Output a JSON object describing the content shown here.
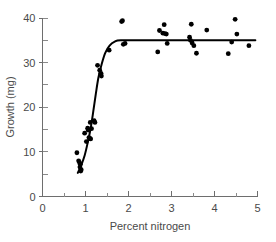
{
  "chart_data": {
    "type": "scatter",
    "title": "",
    "subtitle": "",
    "xlabel": "Percent nitrogen",
    "ylabel": "Growth (mg)",
    "xlim": [
      0,
      5
    ],
    "ylim": [
      0,
      40
    ],
    "grid": false,
    "legend": null,
    "x_ticks": [
      0,
      1,
      2,
      3,
      4,
      5
    ],
    "x_tick_labels": [
      "0",
      "1",
      "2",
      "3",
      "4",
      "5"
    ],
    "x_minor_ticks": [
      0.5,
      1.5,
      2.5,
      3.5,
      4.5
    ],
    "y_ticks": [
      0,
      10,
      20,
      30,
      40
    ],
    "y_tick_labels": [
      "0",
      "10",
      "20",
      "30",
      "40"
    ],
    "y_minor_ticks": [
      5,
      15,
      25,
      35
    ],
    "series": [
      {
        "name": "observations",
        "type": "scatter",
        "marker": "filled-circle",
        "color": "#000000",
        "points": [
          [
            0.8,
            9.8
          ],
          [
            0.84,
            8.0
          ],
          [
            0.86,
            7.6
          ],
          [
            0.87,
            6.6
          ],
          [
            0.88,
            7.2
          ],
          [
            0.89,
            5.7
          ],
          [
            0.9,
            6.0
          ],
          [
            0.98,
            14.2
          ],
          [
            1.02,
            12.3
          ],
          [
            1.05,
            15.3
          ],
          [
            1.06,
            14.9
          ],
          [
            1.08,
            13.2
          ],
          [
            1.1,
            13.0
          ],
          [
            1.11,
            16.6
          ],
          [
            1.12,
            12.9
          ],
          [
            1.14,
            15.2
          ],
          [
            1.2,
            17.0
          ],
          [
            1.22,
            16.6
          ],
          [
            1.28,
            29.4
          ],
          [
            1.33,
            28.3
          ],
          [
            1.36,
            27.6
          ],
          [
            1.37,
            27.0
          ],
          [
            1.55,
            32.8
          ],
          [
            1.84,
            39.2
          ],
          [
            1.86,
            39.4
          ],
          [
            1.88,
            34.1
          ],
          [
            1.92,
            34.3
          ],
          [
            2.68,
            32.4
          ],
          [
            2.72,
            37.2
          ],
          [
            2.8,
            36.6
          ],
          [
            2.83,
            38.5
          ],
          [
            2.85,
            36.5
          ],
          [
            2.88,
            36.4
          ],
          [
            2.9,
            34.3
          ],
          [
            3.42,
            35.7
          ],
          [
            3.44,
            35.0
          ],
          [
            3.46,
            38.6
          ],
          [
            3.48,
            34.4
          ],
          [
            3.52,
            33.8
          ],
          [
            3.58,
            32.1
          ],
          [
            3.82,
            37.3
          ],
          [
            4.32,
            32.0
          ],
          [
            4.4,
            34.6
          ],
          [
            4.48,
            39.7
          ],
          [
            4.52,
            36.4
          ],
          [
            4.8,
            33.8
          ]
        ]
      },
      {
        "name": "fitted-plateau-curve",
        "type": "line",
        "color": "#000000",
        "points": [
          [
            0.82,
            5.3
          ],
          [
            0.9,
            7.0
          ],
          [
            0.98,
            9.2
          ],
          [
            1.05,
            12.0
          ],
          [
            1.12,
            15.3
          ],
          [
            1.18,
            19.0
          ],
          [
            1.24,
            23.0
          ],
          [
            1.3,
            26.6
          ],
          [
            1.38,
            29.8
          ],
          [
            1.46,
            32.2
          ],
          [
            1.56,
            33.8
          ],
          [
            1.68,
            34.7
          ],
          [
            1.82,
            35.0
          ],
          [
            2.4,
            35.0
          ],
          [
            3.2,
            35.0
          ],
          [
            4.1,
            35.0
          ],
          [
            4.95,
            35.0
          ]
        ]
      }
    ],
    "annotations": []
  },
  "axes": {
    "x_title": "Percent nitrogen",
    "y_title": "Growth (mg)"
  }
}
